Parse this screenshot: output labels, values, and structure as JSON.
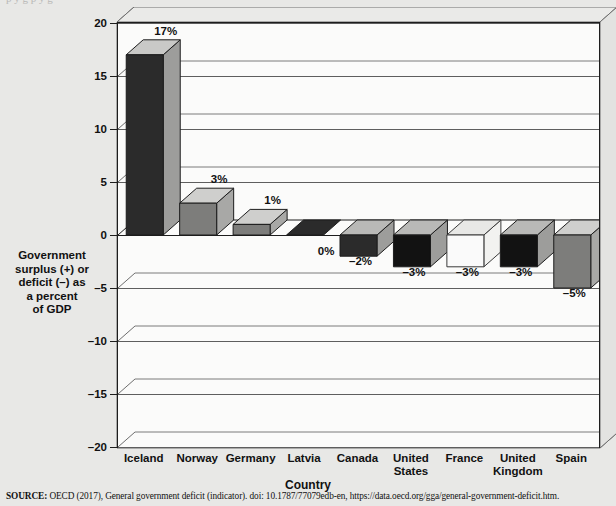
{
  "figure": {
    "top_bleed_text": "p    y      g          p  y      g",
    "source_label": "SOURCE:",
    "source_text": "OECD (2017), General government deficit (indicator). doi: 10.1787/77079edb-en, https://data.oecd.org/gga/general-government-deficit.htm."
  },
  "chart_data": {
    "type": "bar",
    "title": "",
    "subtitle": "",
    "xlabel": "Country",
    "ylabel": "Government surplus (+) or deficit (–) as a percent of GDP",
    "ylabel_lines": [
      "Government",
      "surplus (+) or",
      "deficit (–) as",
      "a percent",
      "of GDP"
    ],
    "categories": [
      "Iceland",
      "Norway",
      "Germany",
      "Latvia",
      "Canada",
      "United States",
      "France",
      "United Kingdom",
      "Spain"
    ],
    "category_lines": [
      [
        "Iceland"
      ],
      [
        "Norway"
      ],
      [
        "Germany"
      ],
      [
        "Latvia"
      ],
      [
        "Canada"
      ],
      [
        "United",
        "States"
      ],
      [
        "France"
      ],
      [
        "United",
        "Kingdom"
      ],
      [
        "Spain"
      ]
    ],
    "values": [
      17,
      3,
      1,
      0,
      -2,
      -3,
      -3,
      -3,
      -5
    ],
    "data_labels": [
      "17%",
      "3%",
      "1%",
      "0%",
      "–2%",
      "–3%",
      "–3%",
      "–3%",
      "–5%"
    ],
    "ylim": [
      -20,
      20
    ],
    "yticks": [
      20,
      15,
      10,
      5,
      0,
      -5,
      -10,
      -15,
      -20
    ],
    "ytick_labels": [
      "20",
      "15",
      "10",
      "5",
      "0",
      "–5",
      "–10",
      "–15",
      "–20"
    ],
    "grid": true,
    "grid_axis": "y",
    "legend": "none",
    "projection": "3d",
    "bar_colors": [
      {
        "front": "#2b2b2b",
        "top": "#c9c9c7",
        "side": "#9d9d9b"
      },
      {
        "front": "#7d7d7b",
        "top": "#cfcfcd",
        "side": "#a8a8a6"
      },
      {
        "front": "#7d7d7b",
        "top": "#cfcfcd",
        "side": "#a8a8a6"
      },
      {
        "front": "#2b2b2b",
        "top": "#2b2b2b",
        "side": "#9d9d9b"
      },
      {
        "front": "#2b2b2b",
        "top": "#b9b9b7",
        "side": "#9d9d9b"
      },
      {
        "front": "#121212",
        "top": "#b9b9b7",
        "side": "#9d9d9b"
      },
      {
        "front": "#fafafa",
        "top": "#e8e8e6",
        "side": "#f2f2f0"
      },
      {
        "front": "#121212",
        "top": "#b9b9b7",
        "side": "#9d9d9b"
      },
      {
        "front": "#7d7d7b",
        "top": "#cfcfcd",
        "side": "#a8a8a6"
      }
    ],
    "colors": {
      "plot_background": "#fbfbfa",
      "page_background": "#e8e8e6",
      "wall_gray": "#a9a9a7",
      "floor_gray": "#9a9a98",
      "axis_line": "#1d1d1d",
      "grid_line": "#5e5e5e"
    }
  }
}
